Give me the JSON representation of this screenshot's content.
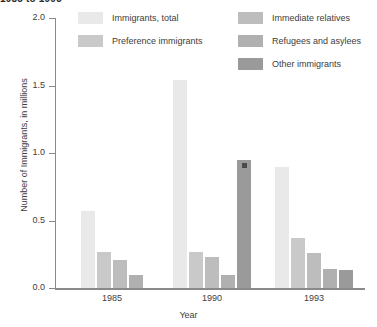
{
  "title": "1985 to 1993",
  "legend": {
    "columns": [
      [
        {
          "label": "Immigrants, total",
          "color": "#e9e9e9"
        },
        {
          "label": "Preference immigrants",
          "color": "#c9c9c9"
        }
      ],
      [
        {
          "label": "Immediate relatives",
          "color": "#bdbdbd"
        },
        {
          "label": "Refugees and asylees",
          "color": "#b0b0b0"
        },
        {
          "label": "Other immigrants",
          "color": "#9a9a9a"
        }
      ]
    ]
  },
  "axes": {
    "y_label": "Number of Immigrants, in millions",
    "y_ticks": [
      "0.0",
      "0.5",
      "1.0",
      "1.5",
      "2.0"
    ],
    "x_label": "Year",
    "x_ticks": [
      "1985",
      "1990",
      "1993"
    ]
  },
  "chart_data": {
    "type": "bar",
    "title": "1985 to 1993",
    "xlabel": "Year",
    "ylabel": "Number of Immigrants, in millions",
    "ylim": [
      0.0,
      2.0
    ],
    "ytick_values": [
      0.0,
      0.5,
      1.0,
      1.5,
      2.0
    ],
    "grid": false,
    "legend_position": "top",
    "categories": [
      "1985",
      "1990",
      "1993"
    ],
    "series": [
      {
        "name": "Immigrants, total",
        "color": "#e9e9e9",
        "values": [
          0.57,
          1.54,
          0.9
        ]
      },
      {
        "name": "Preference immigrants",
        "color": "#c9c9c9",
        "values": [
          0.27,
          0.27,
          0.37
        ]
      },
      {
        "name": "Immediate relatives",
        "color": "#bdbdbd",
        "values": [
          0.21,
          0.23,
          0.26
        ]
      },
      {
        "name": "Refugees and asylees",
        "color": "#b0b0b0",
        "values": [
          0.1,
          0.1,
          0.14
        ]
      },
      {
        "name": "Other immigrants",
        "color": "#9a9a9a",
        "values": [
          null,
          0.95,
          0.13
        ]
      }
    ],
    "annotations": [
      {
        "series": "Other immigrants",
        "category": "1990",
        "marker": "square",
        "color": "#4a4a4a"
      }
    ]
  }
}
